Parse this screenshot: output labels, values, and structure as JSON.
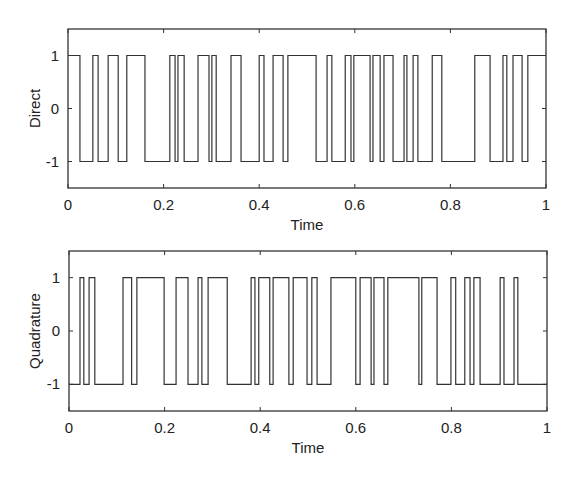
{
  "chart_data": [
    {
      "type": "line",
      "step": true,
      "title": "",
      "xlabel": "Time",
      "ylabel": "Direct",
      "xlim": [
        0,
        1
      ],
      "ylim": [
        -1.5,
        1.5
      ],
      "xticks": [
        "0",
        "0.2",
        "0.4",
        "0.6",
        "0.8",
        "1"
      ],
      "yticks": [
        "-1",
        "0",
        "1"
      ],
      "grid": false,
      "color": "#333333",
      "transitions_t": [
        0.0,
        0.025,
        0.052,
        0.063,
        0.084,
        0.105,
        0.123,
        0.161,
        0.213,
        0.224,
        0.23,
        0.243,
        0.272,
        0.295,
        0.301,
        0.31,
        0.341,
        0.362,
        0.4,
        0.41,
        0.429,
        0.45,
        0.46,
        0.519,
        0.542,
        0.552,
        0.58,
        0.592,
        0.598,
        0.632,
        0.638,
        0.653,
        0.661,
        0.68,
        0.703,
        0.709,
        0.722,
        0.732,
        0.762,
        0.782,
        0.851,
        0.883,
        0.91,
        0.918,
        0.931,
        0.95,
        0.962
      ],
      "levels": [
        1,
        -1,
        1,
        -1,
        1,
        -1,
        1,
        -1,
        1,
        -1,
        1,
        -1,
        1,
        -1,
        1,
        -1,
        1,
        -1,
        1,
        -1,
        1,
        -1,
        1,
        -1,
        1,
        -1,
        1,
        -1,
        1,
        -1,
        1,
        -1,
        1,
        -1,
        1,
        -1,
        1,
        -1,
        1,
        -1,
        1,
        -1,
        1,
        -1,
        1,
        -1,
        1
      ]
    },
    {
      "type": "line",
      "step": true,
      "title": "",
      "xlabel": "Time",
      "ylabel": "Quadrature",
      "xlim": [
        0,
        1
      ],
      "ylim": [
        -1.5,
        1.5
      ],
      "xticks": [
        "0",
        "0.2",
        "0.4",
        "0.6",
        "0.8",
        "1"
      ],
      "yticks": [
        "-1",
        "0",
        "1"
      ],
      "grid": false,
      "color": "#333333",
      "transitions_t": [
        0.0,
        0.023,
        0.031,
        0.042,
        0.054,
        0.113,
        0.131,
        0.142,
        0.199,
        0.224,
        0.249,
        0.27,
        0.278,
        0.291,
        0.331,
        0.381,
        0.389,
        0.397,
        0.42,
        0.427,
        0.46,
        0.469,
        0.498,
        0.508,
        0.519,
        0.548,
        0.6,
        0.609,
        0.632,
        0.638,
        0.659,
        0.667,
        0.732,
        0.738,
        0.77,
        0.799,
        0.809,
        0.828,
        0.839,
        0.847,
        0.86,
        0.902,
        0.91,
        0.931,
        0.939
      ],
      "levels": [
        -1,
        1,
        -1,
        1,
        -1,
        1,
        -1,
        1,
        -1,
        1,
        -1,
        1,
        -1,
        1,
        -1,
        1,
        -1,
        1,
        -1,
        1,
        -1,
        1,
        -1,
        1,
        -1,
        1,
        -1,
        1,
        -1,
        1,
        -1,
        1,
        -1,
        1,
        -1,
        1,
        -1,
        1,
        -1,
        1,
        -1,
        1,
        -1,
        1,
        -1
      ]
    }
  ]
}
